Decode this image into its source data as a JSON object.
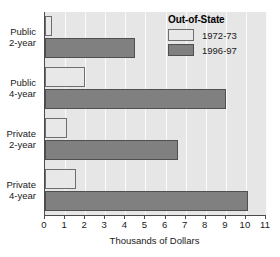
{
  "chart_data": {
    "type": "bar",
    "orientation": "horizontal",
    "title": "",
    "xlabel": "Thousands of Dollars",
    "ylabel": "",
    "xlim": [
      0,
      11
    ],
    "xticks": [
      0,
      1,
      2,
      3,
      4,
      5,
      6,
      7,
      8,
      9,
      10,
      11
    ],
    "xtick_labels": [
      "0",
      "1",
      "2",
      "3",
      "4",
      "5",
      "6",
      "7",
      "8",
      "9",
      "10",
      "11"
    ],
    "grid": true,
    "grid_axis": "x",
    "legend_position": "top-right",
    "legend_title": "Out-of-State",
    "categories": [
      {
        "line1": "Public",
        "line2": "2-year"
      },
      {
        "line1": "Public",
        "line2": "4-year"
      },
      {
        "line1": "Private",
        "line2": "2-year"
      },
      {
        "line1": "Private",
        "line2": "4-year"
      }
    ],
    "category_labels": [
      "Public 2-year",
      "Public 4-year",
      "Private 2-year",
      "Private 4-year"
    ],
    "series": [
      {
        "name": "1972-73",
        "color": "#e8e8e8",
        "values": [
          0.35,
          2.0,
          1.1,
          1.55
        ]
      },
      {
        "name": "1996-97",
        "color": "#808080",
        "values": [
          4.5,
          9.0,
          6.6,
          10.1
        ]
      }
    ]
  },
  "legend": {
    "title": "Out-of-State",
    "entries": [
      {
        "label": "1972-73",
        "swatch": "series-old"
      },
      {
        "label": "1996-97",
        "swatch": "series-new"
      }
    ]
  },
  "axis": {
    "x_title": "Thousands of Dollars"
  },
  "colors": {
    "plot_background": "#e6e6e6",
    "gridline": "#fbfbfb",
    "axis_line": "#4a4a4a",
    "series_old": "#e8e8e8",
    "series_new": "#808080",
    "text": "#1a1a1a"
  }
}
